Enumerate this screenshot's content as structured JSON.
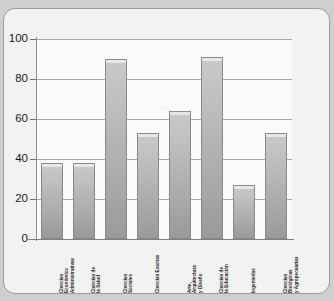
{
  "chart_data": {
    "type": "bar",
    "title": "",
    "xlabel": "",
    "ylabel": "",
    "ylim": [
      0,
      100
    ],
    "yticks": [
      0,
      20,
      40,
      60,
      80,
      100
    ],
    "grid": true,
    "legend": "none",
    "categories": [
      "Ciencias\nEconómico\nAdministrativas",
      "Ciencias de\nla Salud",
      "Ciencias\nSociales",
      "Ciencias Exactas",
      "Arte,\nArquitectura\ny Diseño",
      "Ciencias de\nla Educación",
      "Ingenierías",
      "Ciencias\nBiológicas\ny Agropecuarias"
    ],
    "values": [
      38,
      38,
      90,
      53,
      64,
      91,
      27,
      53
    ],
    "bar_color": "#b4b4b4",
    "bar_edge_color": "#8a8a8a",
    "grid_color": "#a8a8a8",
    "axis_color": "#7f7f7f",
    "plot_background": "#fafaf8",
    "card_background": "#f2f2f0",
    "page_background": "#cfcfcf"
  }
}
